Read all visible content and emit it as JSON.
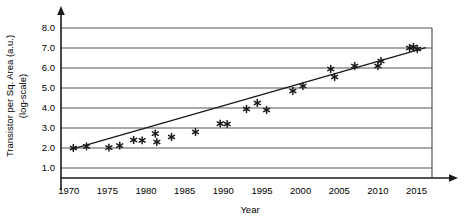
{
  "chart_data": {
    "type": "scatter",
    "title": "",
    "xlabel": "Year",
    "ylabel_line1": "Transistor per Sq. Area (a.u.)",
    "ylabel_line2": "(log-scale)",
    "xlim": [
      1969,
      2017
    ],
    "ylim": [
      0.5,
      8.5
    ],
    "xticks": [
      1970,
      1975,
      1980,
      1985,
      1990,
      1995,
      2000,
      2005,
      2010,
      2015
    ],
    "xtick_labels": [
      "1970",
      "1975",
      "1980",
      "1985",
      "1990",
      "1995",
      "2000",
      "2005",
      "2010",
      "2015"
    ],
    "yticks": [
      1.0,
      2.0,
      3.0,
      4.0,
      5.0,
      6.0,
      7.0,
      8.0
    ],
    "ytick_labels": [
      "1.0",
      "2.0",
      "3.0",
      "4.0",
      "5.0",
      "6.0",
      "7.0",
      "8.0"
    ],
    "grid": "horizontal",
    "legend": "none",
    "marker": "asterisk",
    "marker_color": "#1a1a1a",
    "line_color": "#1a1a1a",
    "axis_color": "#1a1a1a",
    "grid_color": "#555555",
    "series": [
      {
        "name": "measured",
        "type": "scatter",
        "points": [
          {
            "x": 1970.6,
            "y": 2.0
          },
          {
            "x": 1972.3,
            "y": 2.08
          },
          {
            "x": 1975.2,
            "y": 2.02
          },
          {
            "x": 1976.6,
            "y": 2.12
          },
          {
            "x": 1978.4,
            "y": 2.4
          },
          {
            "x": 1979.5,
            "y": 2.38
          },
          {
            "x": 1981.2,
            "y": 2.72
          },
          {
            "x": 1981.4,
            "y": 2.3
          },
          {
            "x": 1983.3,
            "y": 2.55
          },
          {
            "x": 1986.4,
            "y": 2.8
          },
          {
            "x": 1989.6,
            "y": 3.22
          },
          {
            "x": 1990.5,
            "y": 3.2
          },
          {
            "x": 1993.0,
            "y": 3.95
          },
          {
            "x": 1994.4,
            "y": 4.25
          },
          {
            "x": 1995.6,
            "y": 3.9
          },
          {
            "x": 1999.0,
            "y": 4.85
          },
          {
            "x": 2000.3,
            "y": 5.1
          },
          {
            "x": 2003.9,
            "y": 5.95
          },
          {
            "x": 2004.4,
            "y": 5.55
          },
          {
            "x": 2007.0,
            "y": 6.1
          },
          {
            "x": 2010.0,
            "y": 6.1
          },
          {
            "x": 2010.4,
            "y": 6.35
          },
          {
            "x": 2014.1,
            "y": 7.0
          },
          {
            "x": 2014.6,
            "y": 7.05
          },
          {
            "x": 2015.1,
            "y": 6.95
          }
        ]
      },
      {
        "name": "trend-line",
        "type": "line",
        "points": [
          {
            "x": 1970.2,
            "y": 1.92
          },
          {
            "x": 2016.2,
            "y": 7.02
          }
        ]
      }
    ]
  }
}
